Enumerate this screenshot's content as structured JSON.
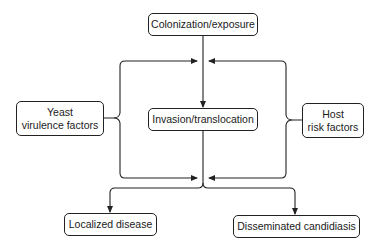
{
  "diagram": {
    "type": "flowchart",
    "colors": {
      "stroke": "#222222",
      "background": "#ffffff",
      "text": "#1a1a1a"
    },
    "nodes": {
      "colonization": {
        "label": "Colonization/exposure"
      },
      "yeast": {
        "line1": "Yeast",
        "line2": "virulence factors"
      },
      "invasion": {
        "label": "Invasion/translocation"
      },
      "host": {
        "line1": "Host",
        "line2": "risk factors"
      },
      "localized": {
        "label": "Localized disease"
      },
      "disseminated": {
        "label": "Disseminated candidiasis"
      }
    },
    "edges": [
      {
        "from": "Colonization/exposure",
        "to": "Invasion/translocation"
      },
      {
        "from": "Yeast virulence factors",
        "to": "Colonization→Invasion path",
        "style": "bracket arrow"
      },
      {
        "from": "Yeast virulence factors",
        "to": "Invasion→Outcome path",
        "style": "bracket arrow"
      },
      {
        "from": "Host risk factors",
        "to": "Colonization→Invasion path",
        "style": "bracket arrow"
      },
      {
        "from": "Host risk factors",
        "to": "Invasion→Outcome path",
        "style": "bracket arrow"
      },
      {
        "from": "Invasion/translocation",
        "to": "Localized disease"
      },
      {
        "from": "Invasion/translocation",
        "to": "Disseminated candidiasis"
      }
    ]
  }
}
